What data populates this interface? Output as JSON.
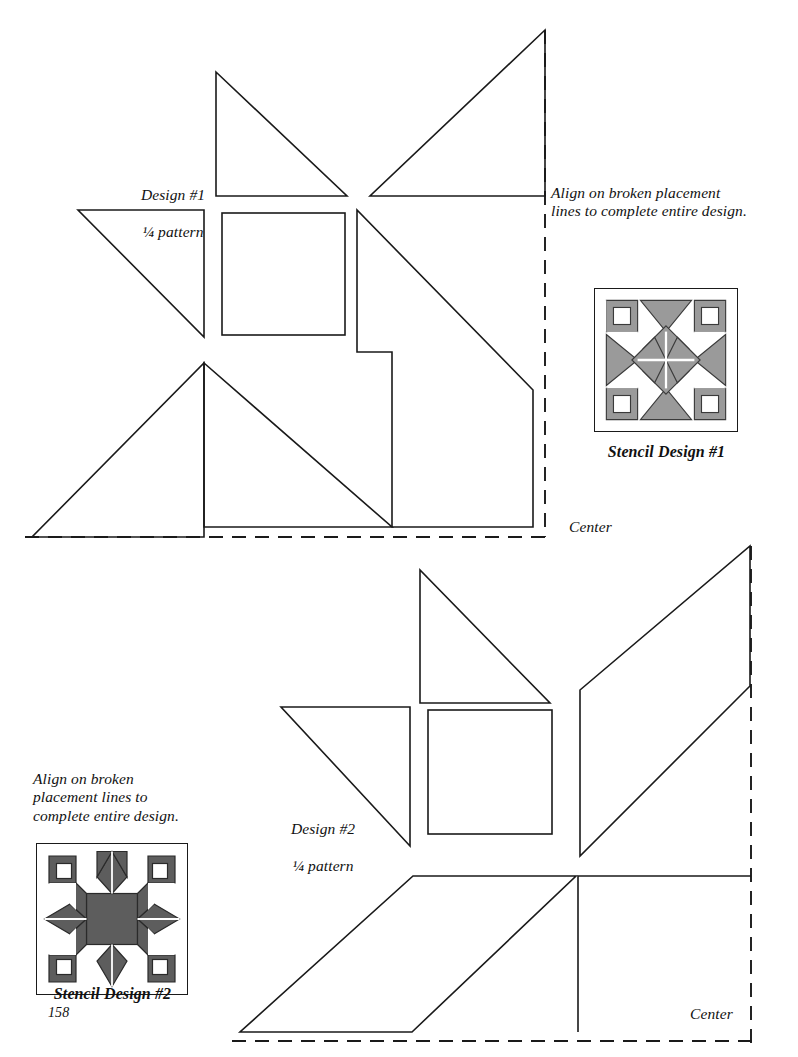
{
  "page": {
    "number": "158",
    "background_color": "#ffffff",
    "ink_color": "#1a1a1a"
  },
  "design1": {
    "title": "Design #1",
    "subtitle_fraction": "¼",
    "subtitle_rest": " pattern",
    "align_note": "Align on broken placement\nlines to complete entire design.",
    "center_label": "Center"
  },
  "design2": {
    "title": "Design #2",
    "subtitle_fraction": "¼",
    "subtitle_rest": " pattern",
    "align_note": "Align on broken\nplacement lines to\ncomplete entire design.",
    "center_label": "Center"
  },
  "stencil1": {
    "caption": "Stencil Design #1",
    "fill_color": "#9a9a9a",
    "stroke_color": "#3a3a3a",
    "frame_color": "#1a1a1a"
  },
  "stencil2": {
    "caption": "Stencil Design #2",
    "fill_color": "#5d5d5d",
    "stroke_color": "#2a2a2a",
    "frame_color": "#1a1a1a"
  },
  "line_style": {
    "solid_width": 1.6,
    "dashed_width": 1.9,
    "dash_pattern": "14 9"
  }
}
